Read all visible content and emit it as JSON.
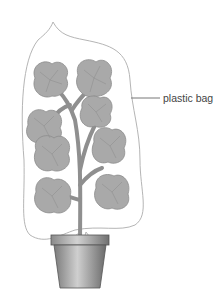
{
  "diagram": {
    "labels": [
      {
        "text": "plastic bag",
        "target": "bag"
      }
    ],
    "colors": {
      "leaf": "#a9a9a9",
      "leaf_edge": "#8c8c8c",
      "stem": "#8f8f8f",
      "pot_light": "#c9c9c9",
      "pot_dark": "#6e6e6e",
      "bag_outline": "#b0b0b0",
      "label_text": "#444444"
    }
  }
}
